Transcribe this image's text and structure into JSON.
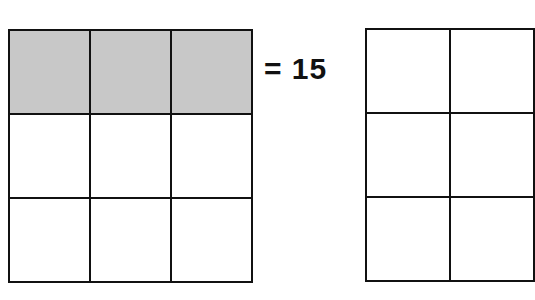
{
  "equation": {
    "text": "= 15"
  },
  "left_grid": {
    "rows": 3,
    "cols": 3,
    "shaded_cells": [
      [
        0,
        0
      ],
      [
        0,
        1
      ],
      [
        0,
        2
      ]
    ],
    "shade_color": "#c8c8c8"
  },
  "right_grid": {
    "rows": 3,
    "cols": 2,
    "shaded_cells": []
  }
}
